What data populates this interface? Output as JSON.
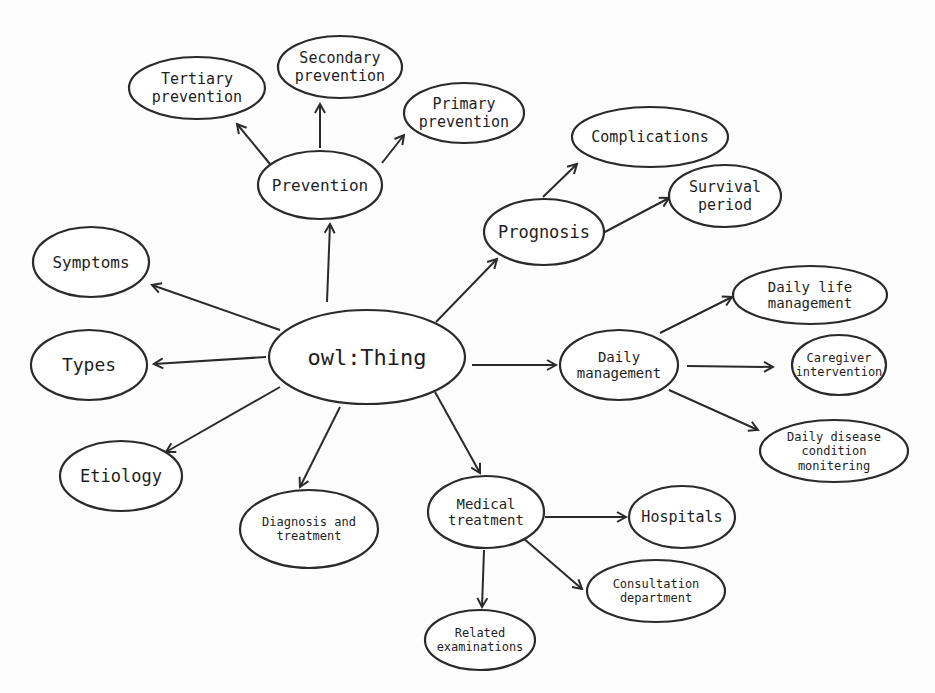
{
  "diagram": {
    "root": {
      "id": "owl-thing",
      "label": "owl:Thing",
      "cx": 367,
      "cy": 357,
      "rx": 98,
      "ry": 47,
      "lines": [
        "owl:Thing"
      ],
      "size": 22
    },
    "nodes": [
      {
        "id": "prevention",
        "lines": [
          "Prevention"
        ],
        "cx": 320,
        "cy": 185,
        "rx": 62,
        "ry": 34,
        "size": 16
      },
      {
        "id": "tertiary-prevention",
        "lines": [
          "Tertiary",
          "prevention"
        ],
        "cx": 197,
        "cy": 88,
        "rx": 68,
        "ry": 31,
        "size": 15
      },
      {
        "id": "secondary-prevention",
        "lines": [
          "Secondary",
          "prevention"
        ],
        "cx": 340,
        "cy": 67,
        "rx": 62,
        "ry": 31,
        "size": 15
      },
      {
        "id": "primary-prevention",
        "lines": [
          "Primary",
          "prevention"
        ],
        "cx": 464,
        "cy": 113,
        "rx": 60,
        "ry": 30,
        "size": 15
      },
      {
        "id": "prognosis",
        "lines": [
          "Prognosis"
        ],
        "cx": 544,
        "cy": 232,
        "rx": 60,
        "ry": 33,
        "size": 17
      },
      {
        "id": "complications",
        "lines": [
          "Complications"
        ],
        "cx": 650,
        "cy": 137,
        "rx": 78,
        "ry": 30,
        "size": 15
      },
      {
        "id": "survival-period",
        "lines": [
          "Survival",
          "period"
        ],
        "cx": 725,
        "cy": 196,
        "rx": 56,
        "ry": 31,
        "size": 15
      },
      {
        "id": "symptoms",
        "lines": [
          "Symptoms"
        ],
        "cx": 91,
        "cy": 262,
        "rx": 58,
        "ry": 35,
        "size": 16
      },
      {
        "id": "types",
        "lines": [
          "Types"
        ],
        "cx": 89,
        "cy": 365,
        "rx": 58,
        "ry": 35,
        "size": 18
      },
      {
        "id": "etiology",
        "lines": [
          "Etiology"
        ],
        "cx": 121,
        "cy": 476,
        "rx": 61,
        "ry": 35,
        "size": 17
      },
      {
        "id": "diagnosis-and-treatment",
        "lines": [
          "Diagnosis and",
          "treatment"
        ],
        "cx": 309,
        "cy": 529,
        "rx": 69,
        "ry": 39,
        "size": 12
      },
      {
        "id": "medical-treatment",
        "lines": [
          "Medical",
          "treatment"
        ],
        "cx": 486,
        "cy": 512,
        "rx": 58,
        "ry": 36,
        "size": 14
      },
      {
        "id": "hospitals",
        "lines": [
          "Hospitals"
        ],
        "cx": 682,
        "cy": 517,
        "rx": 53,
        "ry": 31,
        "size": 15
      },
      {
        "id": "consultation-department",
        "lines": [
          "Consultation",
          "department"
        ],
        "cx": 656,
        "cy": 591,
        "rx": 69,
        "ry": 31,
        "size": 12
      },
      {
        "id": "related-examinations",
        "lines": [
          "Related",
          "examinations"
        ],
        "cx": 480,
        "cy": 640,
        "rx": 55,
        "ry": 30,
        "size": 12
      },
      {
        "id": "daily-management",
        "lines": [
          "Daily",
          "management"
        ],
        "cx": 619,
        "cy": 365,
        "rx": 59,
        "ry": 35,
        "size": 14
      },
      {
        "id": "daily-life-management",
        "lines": [
          "Daily life",
          "management"
        ],
        "cx": 810,
        "cy": 295,
        "rx": 77,
        "ry": 29,
        "size": 14
      },
      {
        "id": "caregiver-intervention",
        "lines": [
          "Caregiver",
          "intervention"
        ],
        "cx": 839,
        "cy": 365,
        "rx": 47,
        "ry": 30,
        "size": 12
      },
      {
        "id": "daily-disease-condition-monitering",
        "lines": [
          "Daily disease",
          "condition",
          "monitering"
        ],
        "cx": 834,
        "cy": 451,
        "rx": 74,
        "ry": 31,
        "size": 12
      }
    ],
    "edges": [
      {
        "from": "owl-thing",
        "to": "prevention",
        "x1": 327,
        "y1": 302,
        "x2": 330,
        "y2": 224
      },
      {
        "from": "owl-thing",
        "to": "symptoms",
        "x1": 280,
        "y1": 330,
        "x2": 152,
        "y2": 285
      },
      {
        "from": "owl-thing",
        "to": "types",
        "x1": 266,
        "y1": 357,
        "x2": 154,
        "y2": 364
      },
      {
        "from": "owl-thing",
        "to": "etiology",
        "x1": 280,
        "y1": 387,
        "x2": 166,
        "y2": 452
      },
      {
        "from": "owl-thing",
        "to": "diagnosis-and-treatment",
        "x1": 340,
        "y1": 407,
        "x2": 300,
        "y2": 487
      },
      {
        "from": "owl-thing",
        "to": "medical-treatment",
        "x1": 435,
        "y1": 392,
        "x2": 480,
        "y2": 473
      },
      {
        "from": "owl-thing",
        "to": "daily-management",
        "x1": 472,
        "y1": 365,
        "x2": 556,
        "y2": 365
      },
      {
        "from": "owl-thing",
        "to": "prognosis",
        "x1": 436,
        "y1": 322,
        "x2": 497,
        "y2": 259
      },
      {
        "from": "prevention",
        "to": "tertiary-prevention",
        "x1": 270,
        "y1": 164,
        "x2": 237,
        "y2": 124
      },
      {
        "from": "prevention",
        "to": "secondary-prevention",
        "x1": 320,
        "y1": 148,
        "x2": 320,
        "y2": 104
      },
      {
        "from": "prevention",
        "to": "primary-prevention",
        "x1": 382,
        "y1": 163,
        "x2": 404,
        "y2": 135
      },
      {
        "from": "prognosis",
        "to": "complications",
        "x1": 543,
        "y1": 197,
        "x2": 577,
        "y2": 164
      },
      {
        "from": "prognosis",
        "to": "survival-period",
        "x1": 603,
        "y1": 233,
        "x2": 669,
        "y2": 198
      },
      {
        "from": "daily-management",
        "to": "daily-life-management",
        "x1": 660,
        "y1": 333,
        "x2": 732,
        "y2": 297
      },
      {
        "from": "daily-management",
        "to": "caregiver-intervention",
        "x1": 687,
        "y1": 366,
        "x2": 773,
        "y2": 367
      },
      {
        "from": "daily-management",
        "to": "daily-disease-condition-monitering",
        "x1": 669,
        "y1": 390,
        "x2": 758,
        "y2": 430
      },
      {
        "from": "medical-treatment",
        "to": "hospitals",
        "x1": 545,
        "y1": 517,
        "x2": 626,
        "y2": 517
      },
      {
        "from": "medical-treatment",
        "to": "consultation-department",
        "x1": 523,
        "y1": 538,
        "x2": 582,
        "y2": 589
      },
      {
        "from": "medical-treatment",
        "to": "related-examinations",
        "x1": 484,
        "y1": 550,
        "x2": 482,
        "y2": 607
      }
    ]
  }
}
